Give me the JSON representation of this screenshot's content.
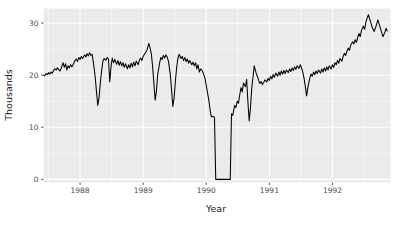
{
  "chart_data": {
    "type": "line",
    "title": "",
    "subtitle": "",
    "xlabel": "Year",
    "ylabel": "Thousands",
    "xlim": [
      1987.42,
      1992.92
    ],
    "ylim": [
      -0.6,
      32.8
    ],
    "grid": true,
    "legend": null,
    "x_ticks": [
      1988,
      1989,
      1990,
      1991,
      1992,
      1993
    ],
    "x_tick_labels": [
      "1988",
      "1989",
      "1990",
      "1991",
      "1992",
      "1993"
    ],
    "x_minor_ticks": [
      1987.5,
      1988.5,
      1989.5,
      1990.5,
      1991.5,
      1992.5
    ],
    "y_ticks": [
      0,
      10,
      20,
      30
    ],
    "y_tick_labels": [
      "0",
      "10",
      "20",
      "30"
    ],
    "y_minor_ticks": [
      5,
      15,
      25
    ],
    "panel_background": "#ebebeb",
    "gridline_color": "#ffffff",
    "line_color": "#000000",
    "series": [
      {
        "name": "value",
        "x": [
          1987.42,
          1987.44,
          1987.46,
          1987.48,
          1987.5,
          1987.52,
          1987.54,
          1987.56,
          1987.58,
          1987.6,
          1987.62,
          1987.64,
          1987.66,
          1987.68,
          1987.7,
          1987.73,
          1987.75,
          1987.77,
          1987.79,
          1987.81,
          1987.83,
          1987.85,
          1987.87,
          1987.9,
          1987.92,
          1987.94,
          1987.96,
          1987.98,
          1988.0,
          1988.02,
          1988.04,
          1988.07,
          1988.09,
          1988.11,
          1988.13,
          1988.15,
          1988.17,
          1988.19,
          1988.21,
          1988.24,
          1988.26,
          1988.28,
          1988.3,
          1988.32,
          1988.34,
          1988.36,
          1988.38,
          1988.41,
          1988.43,
          1988.45,
          1988.47,
          1988.49,
          1988.51,
          1988.53,
          1988.55,
          1988.58,
          1988.6,
          1988.62,
          1988.64,
          1988.66,
          1988.68,
          1988.7,
          1988.72,
          1988.75,
          1988.77,
          1988.79,
          1988.81,
          1988.83,
          1988.85,
          1988.87,
          1988.89,
          1988.92,
          1988.94,
          1988.96,
          1988.98,
          1989.0,
          1989.02,
          1989.04,
          1989.06,
          1989.09,
          1989.11,
          1989.13,
          1989.15,
          1989.17,
          1989.19,
          1989.21,
          1989.23,
          1989.26,
          1989.28,
          1989.3,
          1989.32,
          1989.34,
          1989.36,
          1989.38,
          1989.4,
          1989.43,
          1989.45,
          1989.47,
          1989.49,
          1989.51,
          1989.53,
          1989.55,
          1989.57,
          1989.6,
          1989.62,
          1989.64,
          1989.66,
          1989.68,
          1989.7,
          1989.72,
          1989.74,
          1989.77,
          1989.79,
          1989.81,
          1989.83,
          1989.85,
          1989.87,
          1989.89,
          1989.91,
          1989.94,
          1989.96,
          1989.98,
          1990.0,
          1990.02,
          1990.04,
          1990.06,
          1990.08,
          1990.11,
          1990.13,
          1990.15,
          1990.17,
          1990.19,
          1990.21,
          1990.23,
          1990.25,
          1990.28,
          1990.3,
          1990.32,
          1990.34,
          1990.36,
          1990.38,
          1990.4,
          1990.42,
          1990.45,
          1990.47,
          1990.49,
          1990.51,
          1990.53,
          1990.55,
          1990.57,
          1990.59,
          1990.62,
          1990.64,
          1990.66,
          1990.68,
          1990.7,
          1990.72,
          1990.74,
          1990.76,
          1990.79,
          1990.81,
          1990.83,
          1990.85,
          1990.87,
          1990.89,
          1990.91,
          1990.93,
          1990.96,
          1990.98,
          1991.0,
          1991.02,
          1991.04,
          1991.06,
          1991.08,
          1991.1,
          1991.13,
          1991.15,
          1991.17,
          1991.19,
          1991.21,
          1991.23,
          1991.25,
          1991.27,
          1991.3,
          1991.32,
          1991.34,
          1991.36,
          1991.38,
          1991.4,
          1991.42,
          1991.44,
          1991.47,
          1991.49,
          1991.51,
          1991.53,
          1991.55,
          1991.57,
          1991.59,
          1991.61,
          1991.64,
          1991.66,
          1991.68,
          1991.7,
          1991.72,
          1991.74,
          1991.76,
          1991.78,
          1991.81,
          1991.83,
          1991.85,
          1991.87,
          1991.89,
          1991.91,
          1991.93,
          1991.95,
          1991.98,
          1992.0,
          1992.02,
          1992.04,
          1992.06,
          1992.08,
          1992.1,
          1992.12,
          1992.15,
          1992.17,
          1992.19,
          1992.21,
          1992.23,
          1992.25,
          1992.27,
          1992.29,
          1992.32,
          1992.34,
          1992.36,
          1992.38,
          1992.4,
          1992.42,
          1992.44,
          1992.46,
          1992.49,
          1992.51,
          1992.53,
          1992.55,
          1992.57,
          1992.59,
          1992.61,
          1992.63,
          1992.66,
          1992.68,
          1992.7,
          1992.72,
          1992.74,
          1992.76,
          1992.78,
          1992.8,
          1992.83,
          1992.85,
          1992.87
        ],
        "y": [
          20.0,
          19.9,
          20.3,
          20.1,
          20.5,
          20.2,
          20.6,
          20.4,
          20.9,
          21.2,
          21.0,
          21.4,
          21.1,
          20.8,
          21.3,
          22.4,
          21.5,
          22.2,
          21.0,
          21.8,
          21.4,
          22.0,
          21.6,
          22.3,
          22.8,
          23.1,
          22.6,
          23.4,
          23.0,
          23.6,
          23.2,
          23.9,
          23.5,
          24.1,
          23.7,
          24.3,
          23.8,
          24.0,
          22.5,
          19.6,
          16.8,
          14.2,
          15.6,
          18.4,
          20.7,
          22.6,
          23.2,
          22.9,
          23.4,
          23.1,
          18.7,
          21.6,
          23.3,
          22.4,
          23.0,
          22.1,
          22.8,
          21.9,
          22.6,
          21.8,
          22.4,
          21.5,
          22.2,
          21.2,
          22.0,
          21.4,
          22.3,
          21.6,
          22.5,
          21.8,
          22.7,
          22.0,
          22.9,
          23.3,
          22.8,
          23.6,
          24.0,
          24.4,
          24.8,
          26.1,
          25.2,
          24.0,
          21.6,
          18.4,
          15.2,
          16.9,
          20.1,
          22.3,
          23.4,
          23.0,
          23.8,
          23.3,
          23.9,
          23.5,
          22.7,
          20.1,
          17.2,
          14.0,
          15.6,
          18.8,
          21.4,
          23.2,
          24.0,
          23.2,
          23.6,
          22.8,
          23.4,
          22.6,
          23.1,
          22.3,
          22.8,
          22.0,
          22.5,
          21.8,
          22.4,
          21.2,
          22.0,
          20.6,
          21.2,
          20.8,
          20.1,
          19.4,
          18.0,
          16.6,
          15.2,
          13.4,
          12.0,
          12.1,
          11.9,
          0.0,
          0.0,
          0.0,
          0.0,
          0.0,
          0.0,
          0.0,
          0.0,
          0.0,
          0.0,
          0.0,
          0.0,
          12.6,
          12.3,
          14.2,
          13.8,
          15.0,
          14.6,
          16.2,
          17.6,
          16.8,
          18.5,
          17.8,
          19.2,
          14.9,
          11.2,
          13.6,
          17.4,
          19.6,
          21.8,
          20.4,
          19.8,
          19.0,
          18.4,
          18.8,
          18.2,
          18.6,
          19.1,
          18.7,
          19.4,
          19.0,
          19.8,
          19.3,
          20.1,
          19.6,
          20.4,
          19.8,
          20.6,
          20.0,
          20.8,
          20.2,
          20.9,
          20.3,
          21.0,
          20.5,
          21.2,
          20.7,
          21.4,
          20.9,
          21.6,
          21.1,
          21.8,
          21.3,
          22.0,
          21.4,
          20.6,
          19.4,
          17.8,
          16.0,
          17.6,
          19.4,
          20.2,
          19.8,
          20.6,
          20.1,
          20.8,
          20.3,
          21.0,
          20.4,
          21.2,
          20.6,
          21.4,
          20.8,
          21.6,
          21.0,
          21.8,
          21.2,
          22.0,
          21.5,
          22.4,
          22.0,
          22.8,
          22.3,
          23.2,
          22.7,
          23.6,
          24.2,
          23.8,
          24.6,
          25.2,
          24.8,
          25.8,
          26.4,
          26.0,
          26.8,
          26.3,
          27.2,
          28.0,
          27.4,
          28.6,
          29.4,
          28.8,
          30.2,
          31.0,
          31.6,
          30.8,
          30.0,
          29.2,
          28.4,
          29.0,
          29.8,
          30.6,
          29.8,
          29.0,
          28.2,
          27.4,
          28.2,
          29.0,
          28.4
        ]
      }
    ],
    "annotations": [
      {
        "text": "Series drops to zero for an extended period in late 1989",
        "x_range": [
          1989.98,
          1990.38
        ],
        "y": 0
      }
    ]
  },
  "axis": {
    "y_title": "Thousands",
    "x_title": "Year"
  }
}
